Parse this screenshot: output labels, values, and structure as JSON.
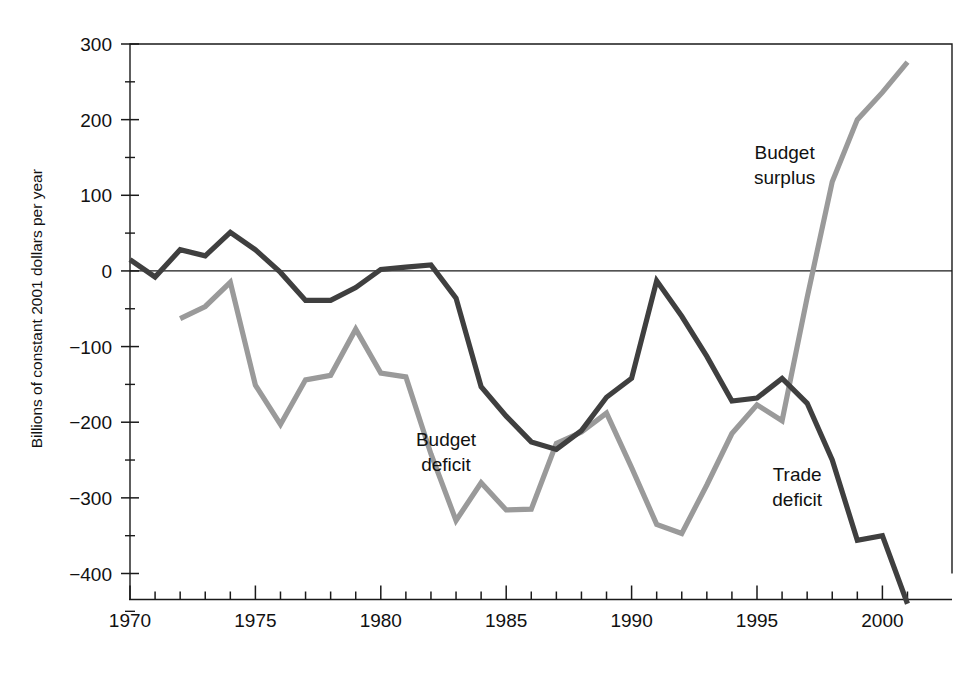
{
  "chart_data": {
    "type": "line",
    "title": "",
    "xlabel": "",
    "ylabel": "Billions of constant 2001 dollars per year",
    "xlim": [
      1970,
      2001.5
    ],
    "ylim": [
      -450,
      300
    ],
    "grid": false,
    "legend": "inline-annotations",
    "x_ticks_major": [
      1970,
      1975,
      1980,
      1985,
      1990,
      1995,
      2000
    ],
    "x_ticks_major_labels": [
      "1970",
      "1975",
      "1980",
      "1985",
      "1990",
      "1995",
      "2000"
    ],
    "x_tick_minor_step": 1,
    "y_ticks_major": [
      300,
      200,
      100,
      0,
      -100,
      -200,
      -300,
      -400
    ],
    "y_ticks_major_labels": [
      "300",
      "200",
      "100",
      "0",
      "−100",
      "−200",
      "−300",
      "−400"
    ],
    "y_tick_minor": [
      250,
      150,
      50,
      -50,
      -150,
      -250,
      -350,
      -450
    ],
    "zero_line": 0,
    "annotations": [
      {
        "name": "budget-surplus",
        "text_lines": [
          "Budget",
          "surplus"
        ],
        "x": 1996.1,
        "y": 148,
        "series": "Budget surplus"
      },
      {
        "name": "budget-deficit",
        "text_lines": [
          "Budget",
          "deficit"
        ],
        "x": 1982.6,
        "y": -232,
        "series": "Budget deficit"
      },
      {
        "name": "trade-deficit",
        "text_lines": [
          "Trade",
          "deficit"
        ],
        "x": 1996.6,
        "y": -278,
        "series": "Trade deficit"
      }
    ],
    "series": [
      {
        "name": "Trade deficit",
        "color": "#3f3f3f",
        "width": 5.2,
        "x": [
          1970,
          1971,
          1972,
          1973,
          1974,
          1975,
          1976,
          1977,
          1978,
          1979,
          1980,
          1981,
          1982,
          1983,
          1984,
          1985,
          1986,
          1987,
          1988,
          1989,
          1990,
          1991,
          1992,
          1993,
          1994,
          1995,
          1996,
          1997,
          1998,
          1999,
          2000,
          2001
        ],
        "values": [
          15,
          -8,
          28,
          20,
          51,
          28,
          -2,
          -39,
          -39,
          -22,
          2,
          5,
          8,
          -36,
          -153,
          -192,
          -226,
          -236,
          -211,
          -167,
          -142,
          -13,
          -60,
          -113,
          -172,
          -168,
          -142,
          -175,
          -250,
          -356,
          -350,
          -440
        ]
      },
      {
        "name": "Budget surplus",
        "color": "#9a9a9a",
        "width": 5.2,
        "x": [
          1972,
          1973,
          1974,
          1975,
          1976,
          1977,
          1978,
          1979,
          1980,
          1981,
          1982,
          1983,
          1984,
          1985,
          1986,
          1987,
          1988,
          1989,
          1990,
          1991,
          1992,
          1993,
          1994,
          1995,
          1996,
          1997,
          1998,
          1999,
          2000,
          2001
        ],
        "values": [
          -63,
          -47,
          -15,
          -151,
          -203,
          -144,
          -138,
          -77,
          -135,
          -140,
          -242,
          -330,
          -280,
          -316,
          -315,
          -228,
          -213,
          -188,
          -260,
          -335,
          -347,
          -283,
          -215,
          -177,
          -198,
          -35,
          118,
          200,
          236,
          276
        ]
      }
    ]
  },
  "axis": {
    "y_title": "Billions of constant 2001 dollars per year"
  }
}
